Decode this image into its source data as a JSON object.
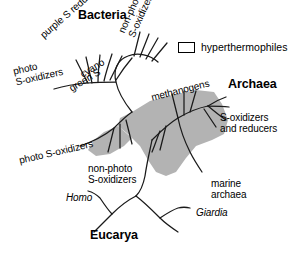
{
  "figure": {
    "type": "unrooted-phylogenetic-tree",
    "background_color": "#ffffff",
    "line_color": "#1a1a1a",
    "highlight_color": "#b3b3b3"
  },
  "domains": [
    {
      "id": "bacteria",
      "label": "Bacteria",
      "x": 78,
      "y": 8
    },
    {
      "id": "archaea",
      "label": "Archaea",
      "x": 228,
      "y": 77
    },
    {
      "id": "eucarya",
      "label": "Eucarya",
      "x": 90,
      "y": 228
    }
  ],
  "legend": {
    "label": "hyperthermophiles",
    "swatch_fill": "#ffffff",
    "swatch_border": "#000000",
    "x": 178,
    "y": 41
  },
  "taxa": [
    {
      "id": "purple-s-reducers",
      "label": "purple S reducers",
      "x": 38,
      "y": 32,
      "rotate": -41,
      "italic": false,
      "lines": [
        "purple S reducers"
      ]
    },
    {
      "id": "photo-s-oxidizers-upper",
      "label": "photo S-oxidizers",
      "x": 12,
      "y": 66,
      "rotate": -13,
      "italic": false,
      "lines": [
        "photo",
        "S-oxidizers"
      ]
    },
    {
      "id": "cyano",
      "label": "cyano",
      "x": 78,
      "y": 70,
      "rotate": -31,
      "italic": false,
      "lines": [
        "cyano"
      ]
    },
    {
      "id": "green-s",
      "label": "green S",
      "x": 67,
      "y": 84,
      "rotate": -31,
      "italic": false,
      "lines": [
        "green S"
      ]
    },
    {
      "id": "non-photo-s-oxidizers-upper",
      "label": "non-photo S-oxidizers",
      "x": 116,
      "y": 30,
      "rotate": -66,
      "italic": false,
      "lines": [
        "non-photo",
        "S-oxidizers"
      ]
    },
    {
      "id": "methanogens",
      "label": "methanogens",
      "x": 150,
      "y": 92,
      "rotate": -14,
      "italic": false,
      "lines": [
        "methanogens"
      ]
    },
    {
      "id": "s-oxidizers-and-reducers",
      "label": "S-oxidizers and reducers",
      "x": 220,
      "y": 112,
      "rotate": 0,
      "italic": false,
      "lines": [
        "S-oxidizers",
        "and reducers"
      ]
    },
    {
      "id": "photo-s-oxidizers-lower",
      "label": "photo S-oxidizers",
      "x": 18,
      "y": 155,
      "rotate": -13,
      "italic": false,
      "lines": [
        "photo S-oxidizers"
      ]
    },
    {
      "id": "non-photo-s-oxidizers-lower",
      "label": "non-photo S-oxidizers",
      "x": 88,
      "y": 163,
      "rotate": 0,
      "italic": false,
      "lines": [
        "non-photo",
        "S-oxidizers"
      ]
    },
    {
      "id": "marine-archaea",
      "label": "marine archaea",
      "x": 211,
      "y": 178,
      "rotate": 0,
      "italic": false,
      "lines": [
        "marine",
        "archaea"
      ]
    },
    {
      "id": "homo",
      "label": "Homo",
      "x": 66,
      "y": 192,
      "rotate": 0,
      "italic": true,
      "lines": [
        "Homo"
      ]
    },
    {
      "id": "giardia",
      "label": "Giardia",
      "x": 196,
      "y": 207,
      "rotate": 0,
      "italic": true,
      "lines": [
        "Giardia"
      ]
    }
  ]
}
